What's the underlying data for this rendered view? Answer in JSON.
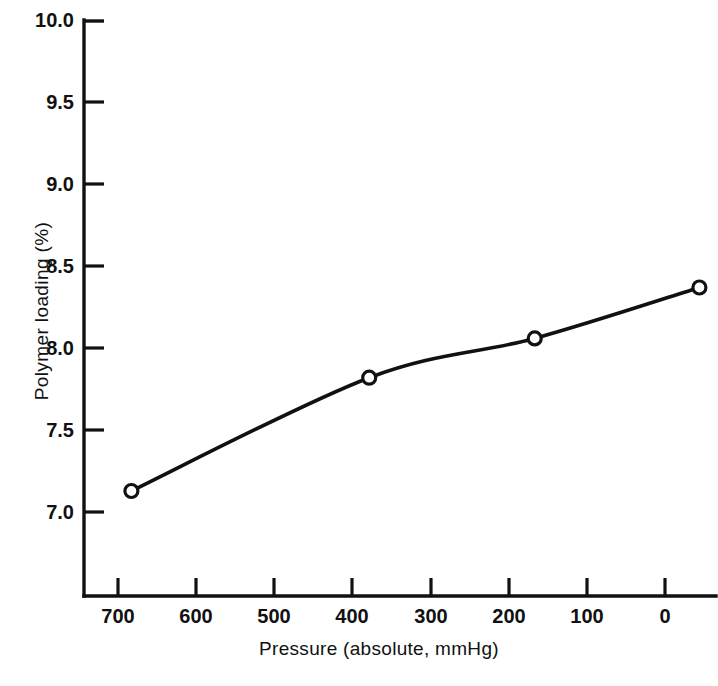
{
  "chart_data": {
    "type": "line",
    "title": "",
    "xlabel": "Pressure (absolute, mmHg)",
    "ylabel": "Polymer loading (%)",
    "xlim": [
      740,
      -20
    ],
    "ylim": [
      6.49,
      10.0
    ],
    "x_reversed": true,
    "grid": false,
    "legend": null,
    "xticks": [
      700,
      600,
      500,
      400,
      300,
      200,
      100,
      0
    ],
    "xtick_labels": [
      "700",
      "600",
      "500",
      "400",
      "300",
      "200",
      "100",
      "0"
    ],
    "yticks": [
      7.0,
      7.5,
      8.0,
      8.5,
      9.0,
      9.5,
      10.0
    ],
    "ytick_labels": [
      "7.0",
      "7.5",
      "8.0",
      "8.5",
      "9.0",
      "9.5",
      "10.0"
    ],
    "series": [
      {
        "name": "Polymer loading vs pressure",
        "marker": "open-circle",
        "x": [
          683,
          397,
          198,
          0
        ],
        "y": [
          7.13,
          7.82,
          8.06,
          8.37
        ]
      }
    ],
    "curve_note": "smooth concave-down fitted curve through the four open-circle points"
  },
  "figure": {
    "axis_color": "#111111",
    "line_color": "#111111",
    "marker_fill": "#ffffff",
    "background": "#ffffff",
    "caption_scrap": ""
  }
}
